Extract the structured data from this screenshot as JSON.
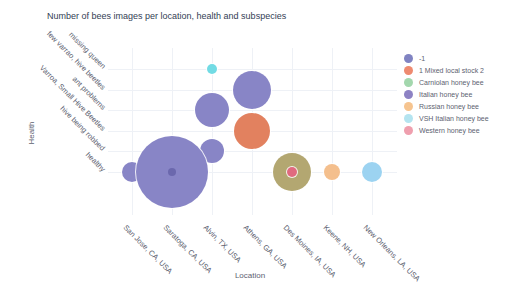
{
  "title": "Number of bees images per location, health and subspecies",
  "x_axis": {
    "title": "Location",
    "categories": [
      "San Jose, CA, USA",
      "Saratoga, CA, USA",
      "Alvin, TX, USA",
      "Athens, GA, USA",
      "Des Moines, IA, USA",
      "Keene, NH, USA",
      "New Orleans, LA, USA"
    ]
  },
  "y_axis": {
    "title": "Health",
    "categories": [
      "missing queen",
      "few varrao, hive beetles",
      "ant problems",
      "Varroa, Small Hive Beetles",
      "hive being robbed",
      "healthy"
    ]
  },
  "legend": {
    "items": [
      {
        "label": "-1",
        "color": "#8083c2"
      },
      {
        "label": "1 Mixed local stock 2",
        "color": "#ee8a70"
      },
      {
        "label": "Carniolan honey bee",
        "color": "#a3d7ad"
      },
      {
        "label": "Italian honey bee",
        "color": "#8d82c4"
      },
      {
        "label": "Russian honey bee",
        "color": "#f6c48f"
      },
      {
        "label": "VSH Italian honey bee",
        "color": "#b4e4f0"
      },
      {
        "label": "Western honey bee",
        "color": "#ef9fae"
      }
    ]
  },
  "chart_data": {
    "type": "scatter",
    "subtype": "bubble",
    "title": "Number of bees images per location, health and subspecies",
    "xlabel": "Location",
    "ylabel": "Health",
    "grid": "faint",
    "legend_position": "right",
    "size_encoding": "bubble area = number of images (numeric values not labeled in figure); radius_px is rendered size",
    "points": [
      {
        "location": "San Jose, CA, USA",
        "health": "healthy",
        "series": "-1",
        "color": "#8885c6",
        "radius_px": 10
      },
      {
        "location": "Alvin, TX, USA",
        "health": "hive being robbed",
        "series": "-1",
        "color": "#8885c6",
        "radius_px": 12
      },
      {
        "location": "Saratoga, CA, USA",
        "health": "healthy",
        "series": "-1",
        "color": "#8885c6",
        "radius_px": 36
      },
      {
        "location": "Athens, GA, USA",
        "health": "few varrao, hive beetles",
        "series": "-1",
        "color": "#8885c6",
        "radius_px": 19
      },
      {
        "location": "Alvin, TX, USA",
        "health": "ant problems",
        "series": "-1",
        "color": "#8885c6",
        "radius_px": 17
      },
      {
        "location": "Athens, GA, USA",
        "health": "Varroa, Small Hive Beetles",
        "series": "1 Mixed local stock 2",
        "color": "#e2815f",
        "radius_px": 18
      },
      {
        "location": "Des Moines, IA, USA",
        "health": "healthy",
        "series": "overlapping markers (appears khaki)",
        "color": "#b3a771",
        "radius_px": 19
      },
      {
        "location": "Keene, NH, USA",
        "health": "healthy",
        "series": "Russian honey bee",
        "color": "#f4bf8d",
        "radius_px": 8
      },
      {
        "location": "New Orleans, LA, USA",
        "health": "healthy",
        "series": "VSH Italian honey bee",
        "color": "#9cd3f1",
        "radius_px": 10
      },
      {
        "location": "Alvin, TX, USA",
        "health": "missing queen",
        "series": "VSH Italian honey bee",
        "color": "#72dbe4",
        "radius_px": 5
      },
      {
        "location": "Saratoga, CA, USA",
        "health": "healthy",
        "series": "Italian honey bee",
        "color": "#6b68ad",
        "radius_px": 4,
        "ring": false
      },
      {
        "location": "Des Moines, IA, USA",
        "health": "healthy",
        "series": "Western honey bee",
        "color": "#e06a7f",
        "radius_px": 5
      }
    ]
  }
}
